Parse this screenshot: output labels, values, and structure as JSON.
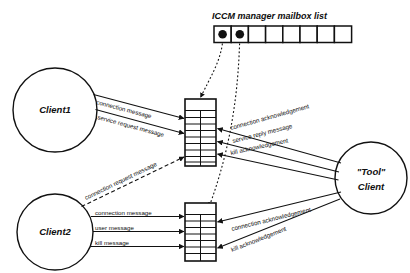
{
  "figure": {
    "background_color": "#ffffff",
    "line_color": "#111111",
    "width": 410,
    "height": 273
  },
  "mailbox_list": {
    "title": "ICCM manager mailbox list",
    "cell_count": 8,
    "cells": [
      {
        "index": 1,
        "occupied": true
      },
      {
        "index": 2,
        "occupied": true
      },
      {
        "index": 3,
        "occupied": false
      },
      {
        "index": 4,
        "occupied": false
      },
      {
        "index": 5,
        "occupied": false
      },
      {
        "index": 6,
        "occupied": false
      },
      {
        "index": 7,
        "occupied": false
      },
      {
        "index": 8,
        "occupied": false
      }
    ]
  },
  "nodes": {
    "client1": {
      "label": "Client1"
    },
    "client2": {
      "label": "Client2"
    },
    "tool_client": {
      "label_line1": "\"Tool\"",
      "label_line2": "Client"
    },
    "mailbox_upper": {
      "row_count": 10
    },
    "mailbox_lower": {
      "row_count": 9
    }
  },
  "edges": {
    "client1_connection": "connection message",
    "client1_service_request": "service request message",
    "client2_connection_request": "connection request message",
    "client2_connection": "connection message",
    "client2_user": "user message",
    "client2_kill": "kill message",
    "tool_connection_ack_upper": "connection acknowledgement",
    "tool_service_reply": "service reply message",
    "tool_kill_ack_upper": "kill acknowledgement",
    "tool_connection_ack_lower": "connection acknowledgement",
    "tool_kill_ack_lower": "kill acknowledgement"
  }
}
